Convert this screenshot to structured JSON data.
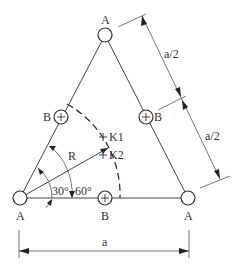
{
  "diagram": {
    "nodes": {
      "top": {
        "label": "A"
      },
      "bottom_left": {
        "label": "A"
      },
      "bottom_right": {
        "label": "A"
      },
      "mid_left": {
        "label": "B"
      },
      "mid_right": {
        "label": "B"
      },
      "mid_bottom": {
        "label": "B"
      }
    },
    "points": {
      "k1": {
        "label": "K1"
      },
      "k2": {
        "label": "K2"
      }
    },
    "radius_label": "R",
    "angles": {
      "first": "30°",
      "second": "60°"
    },
    "dimensions": {
      "side_upper_half": "a/2",
      "side_lower_half": "a/2",
      "base": "a"
    }
  }
}
